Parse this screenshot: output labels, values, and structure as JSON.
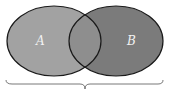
{
  "diagram": {
    "type": "venn",
    "sets": [
      {
        "label": "A",
        "color": "#a2a2a2"
      },
      {
        "label": "B",
        "color": "#7b7b7b"
      }
    ],
    "overlap_color": "#8e8e8e",
    "outline_color": "#1a1a1a",
    "brace": "under both sets"
  }
}
